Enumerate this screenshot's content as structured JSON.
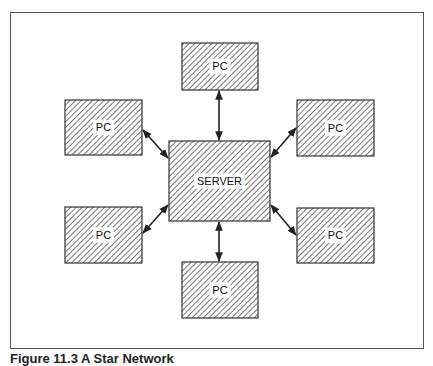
{
  "diagram": {
    "type": "star-network",
    "server": {
      "label": "SERVER",
      "x": 169,
      "y": 141,
      "w": 101,
      "h": 80
    },
    "nodes": [
      {
        "id": "pc-top",
        "label": "PC",
        "x": 182,
        "y": 43,
        "w": 76,
        "h": 47
      },
      {
        "id": "pc-upper-left",
        "label": "PC",
        "x": 65,
        "y": 100,
        "w": 77,
        "h": 55
      },
      {
        "id": "pc-upper-right",
        "label": "PC",
        "x": 297,
        "y": 100,
        "w": 77,
        "h": 56
      },
      {
        "id": "pc-lower-left",
        "label": "PC",
        "x": 65,
        "y": 207,
        "w": 77,
        "h": 56
      },
      {
        "id": "pc-lower-right",
        "label": "PC",
        "x": 297,
        "y": 208,
        "w": 77,
        "h": 55
      },
      {
        "id": "pc-bottom",
        "label": "PC",
        "x": 182,
        "y": 262,
        "w": 76,
        "h": 56
      }
    ],
    "links": [
      {
        "from": "pc-top",
        "x1": 219,
        "y1": 91,
        "x2": 219,
        "y2": 140
      },
      {
        "from": "pc-upper-left",
        "x1": 143,
        "y1": 130,
        "x2": 168,
        "y2": 158
      },
      {
        "from": "pc-upper-right",
        "x1": 296,
        "y1": 128,
        "x2": 271,
        "y2": 157
      },
      {
        "from": "pc-lower-left",
        "x1": 143,
        "y1": 233,
        "x2": 168,
        "y2": 205
      },
      {
        "from": "pc-lower-right",
        "x1": 296,
        "y1": 235,
        "x2": 271,
        "y2": 205
      },
      {
        "from": "pc-bottom",
        "x1": 219,
        "y1": 222,
        "x2": 219,
        "y2": 261
      }
    ],
    "colors": {
      "stroke": "#333333",
      "hatch": "#555555",
      "fill": "#ffffff"
    }
  },
  "caption": "Figure 11.3   A Star Network"
}
